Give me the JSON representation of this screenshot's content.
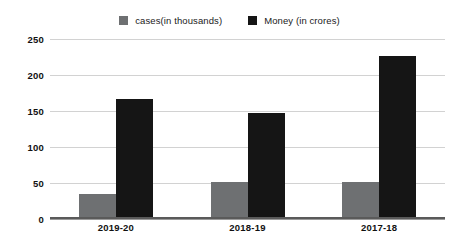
{
  "chart_data": {
    "type": "bar",
    "title": "",
    "xlabel": "",
    "ylabel": "",
    "categories": [
      "2019-20",
      "2018-19",
      "2017-18"
    ],
    "series": [
      {
        "name": "cases(in thousands)",
        "color": "#6e7072",
        "values": [
          35,
          52,
          51
        ]
      },
      {
        "name": "Money (in crores)",
        "color": "#151515",
        "values": [
          166,
          147,
          226
        ]
      }
    ],
    "ylim": [
      0,
      250
    ],
    "yticks": [
      0,
      50,
      100,
      150,
      200,
      250
    ],
    "ytick_labels": [
      "0",
      "50",
      "100",
      "150",
      "200",
      "250"
    ],
    "grid": true,
    "grid_axis": "y",
    "legend": {
      "position": "top-center"
    }
  }
}
